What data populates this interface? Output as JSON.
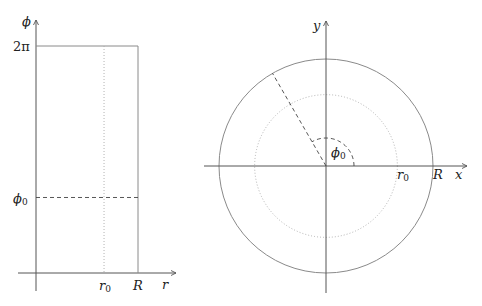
{
  "figures": {
    "left": {
      "description": "Rectangle domain in (r, phi) coordinates",
      "axes": {
        "horizontal_label": "r",
        "vertical_label": "ϕ"
      },
      "ticks": {
        "phi_top": "2π",
        "phi0": "ϕ",
        "phi0_sub": "0",
        "r0": "r",
        "r0_sub": "0",
        "R": "R"
      },
      "values": {
        "R": 1,
        "r0_over_R": 0.667,
        "phi_max_rad": 6.2832,
        "phi0_rad": 2.09
      }
    },
    "right": {
      "description": "Disk of radius R in (x, y) coordinates with circle of radius r0 and ray at angle phi0",
      "axes": {
        "horizontal_label": "x",
        "vertical_label": "y"
      },
      "labels": {
        "r0": "r",
        "r0_sub": "0",
        "R": "R",
        "phi0": "ϕ",
        "phi0_sub": "0"
      },
      "values": {
        "R": 1,
        "r0_over_R": 0.667,
        "phi0_deg": 120
      }
    }
  },
  "colors": {
    "axis": "#555555",
    "boundary": "#8a8a8a",
    "dashed": "#444444",
    "dotted": "#aaaaaa"
  }
}
